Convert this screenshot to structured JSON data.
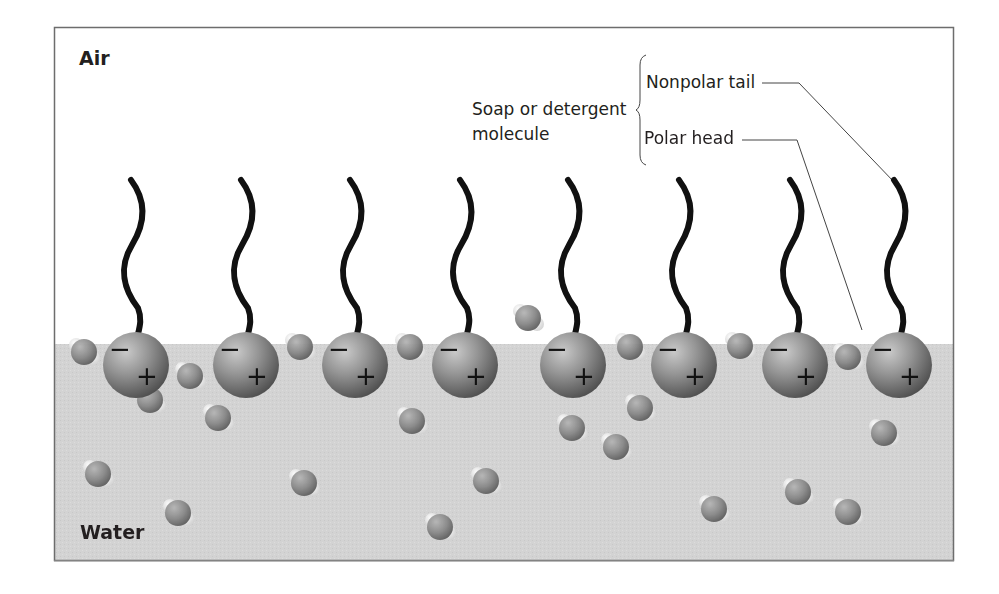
{
  "figure": {
    "regions": {
      "air_label": "Air",
      "water_label": "Water"
    },
    "annotations": {
      "group_label_line1": "Soap or detergent",
      "group_label_line2": "molecule",
      "tail_label": "Nonpolar tail",
      "head_label": "Polar head"
    },
    "charges": {
      "negative": "−",
      "positive": "+"
    },
    "colors": {
      "frame": "#6d6d6d",
      "water": "#d2d2d2",
      "air": "#ffffff",
      "tail": "#111111",
      "head": "#8a8a8a",
      "text": "#231f20"
    },
    "surfactant_count": 8,
    "surfactant_head_x": [
      136,
      246,
      355,
      465,
      573,
      684,
      795,
      899
    ],
    "water_surface_y": 344
  }
}
